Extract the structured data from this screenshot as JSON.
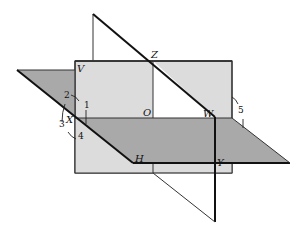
{
  "diagram": {
    "type": "three intersecting planes (dihedral angles)",
    "colors": {
      "vertical_plane_fill": "#dcdcdc",
      "horizontal_plane_fill": "#a9a9a9",
      "stroke": "#111111",
      "background": "#ffffff"
    },
    "point_labels": {
      "V": "V",
      "Z": "Z",
      "O": "O",
      "W": "W",
      "X": "X",
      "H": "H",
      "Y": "Y"
    },
    "angle_labels": {
      "a1": "1",
      "a2": "2",
      "a3": "3",
      "a4": "4",
      "a5": "5"
    }
  }
}
